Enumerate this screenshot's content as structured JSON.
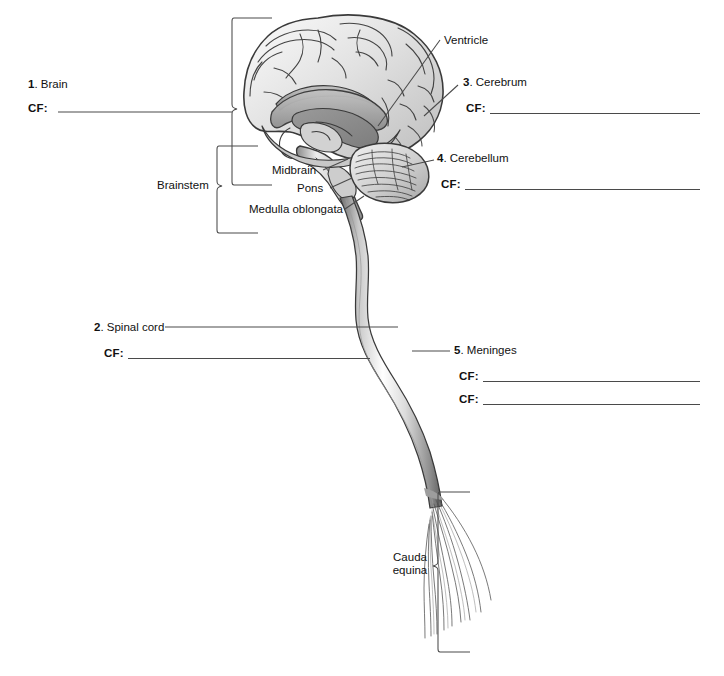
{
  "worksheet": {
    "cf_label": "CF:",
    "items": [
      {
        "number": "1",
        "name": "Brain",
        "cf_count": 1
      },
      {
        "number": "2",
        "name": "Spinal cord",
        "cf_count": 1
      },
      {
        "number": "3",
        "name": "Cerebrum",
        "cf_count": 1
      },
      {
        "number": "4",
        "name": "Cerebellum",
        "cf_count": 1
      },
      {
        "number": "5",
        "name": "Meninges",
        "cf_count": 2
      }
    ],
    "plain_labels": [
      {
        "id": "ventricle",
        "text": "Ventricle"
      },
      {
        "id": "brainstem",
        "text": "Brainstem"
      },
      {
        "id": "midbrain",
        "text": "Midbrain"
      },
      {
        "id": "pons",
        "text": "Pons"
      },
      {
        "id": "medulla-oblongata",
        "text": "Medulla oblongata"
      },
      {
        "id": "cauda-equina-1",
        "text": "Cauda"
      },
      {
        "id": "cauda-equina-2",
        "text": "equina"
      }
    ]
  },
  "illustration": {
    "name": "central-nervous-system-sagittal-illustration",
    "parts": [
      "cerebrum",
      "corpus-callosum",
      "ventricle",
      "cerebellum",
      "midbrain",
      "pons",
      "medulla-oblongata",
      "spinal-cord",
      "cauda-equina"
    ],
    "colors": {
      "outline": "#3a3a3a",
      "tissue_light": "#f2f2f2",
      "tissue_mid": "#b9b9b9",
      "tissue_dark": "#8d8d8d",
      "rule": "#4a4a4a",
      "leader": "#4a4a4a"
    }
  }
}
